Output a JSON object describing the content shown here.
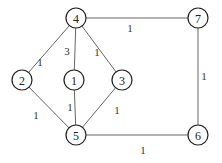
{
  "graph": {
    "nodes": [
      {
        "id": "4",
        "label": "4",
        "x": 76,
        "y": 18
      },
      {
        "id": "7",
        "label": "7",
        "x": 198,
        "y": 18
      },
      {
        "id": "2",
        "label": "2",
        "x": 22,
        "y": 80
      },
      {
        "id": "1",
        "label": "1",
        "x": 74,
        "y": 80
      },
      {
        "id": "3",
        "label": "3",
        "x": 122,
        "y": 80
      },
      {
        "id": "5",
        "label": "5",
        "x": 76,
        "y": 135
      },
      {
        "id": "6",
        "label": "6",
        "x": 198,
        "y": 135
      }
    ],
    "edges": [
      {
        "from": "4",
        "to": "7",
        "weight": "1",
        "lx": 130,
        "ly": 28
      },
      {
        "from": "4",
        "to": "2",
        "weight": "1",
        "lx": 40,
        "ly": 62
      },
      {
        "from": "4",
        "to": "1",
        "weight": "3",
        "lx": 67,
        "ly": 51
      },
      {
        "from": "4",
        "to": "3",
        "weight": "1",
        "lx": 97,
        "ly": 52
      },
      {
        "from": "2",
        "to": "5",
        "weight": "1",
        "lx": 36,
        "ly": 115
      },
      {
        "from": "1",
        "to": "5",
        "weight": "1",
        "lx": 70,
        "ly": 107
      },
      {
        "from": "3",
        "to": "5",
        "weight": "1",
        "lx": 117,
        "ly": 110
      },
      {
        "from": "5",
        "to": "6",
        "weight": "1",
        "lx": 143,
        "ly": 150
      },
      {
        "from": "7",
        "to": "6",
        "weight": "1",
        "lx": 204,
        "ly": 76
      }
    ],
    "node_radius": 10
  }
}
